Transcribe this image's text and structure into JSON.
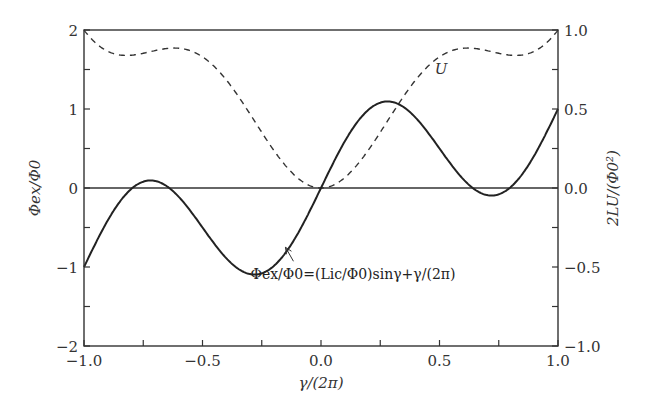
{
  "chart_data": {
    "type": "line",
    "title": "",
    "xlabel": "γ/(2π)",
    "ylabel_left": "Φex/Φ0",
    "ylabel_right": "2LU/(Φ0²)",
    "xlim": [
      -1.0,
      1.0
    ],
    "ylim_left": [
      -2,
      2
    ],
    "ylim_right": [
      -1.0,
      1.0
    ],
    "x_ticks": [
      "−1.0",
      "−0.5",
      "0.0",
      "0.5",
      "1.0"
    ],
    "y_ticks_left": [
      "2",
      "1",
      "0",
      "−1",
      "−2"
    ],
    "y_ticks_right": [
      "1.0",
      "0.5",
      "0.0",
      "−0.5",
      "−1.0"
    ],
    "grid": false,
    "zero_line": true,
    "series": [
      {
        "name": "Φex/Φ0",
        "style": "solid",
        "axis": "left",
        "formula": "Φex/Φ0 = (Lic/Φ0) sinγ + γ/(2π)",
        "x": [
          -1.0,
          -0.875,
          -0.73,
          -0.5,
          -0.27,
          -0.125,
          0.0,
          0.125,
          0.27,
          0.5,
          0.73,
          0.875,
          1.0
        ],
        "values": [
          -1.0,
          -0.46,
          0.1,
          -0.5,
          -1.1,
          -0.71,
          0.0,
          0.71,
          1.1,
          0.5,
          -0.1,
          0.46,
          1.0
        ]
      },
      {
        "name": "U",
        "style": "dashed",
        "axis": "right",
        "x": [
          -1.0,
          -0.75,
          -0.5,
          -0.25,
          0.0,
          0.25,
          0.5,
          0.75,
          1.0
        ],
        "values": [
          1.0,
          0.85,
          0.83,
          0.35,
          0.0,
          0.35,
          0.83,
          0.85,
          1.0
        ]
      }
    ],
    "annotations": [
      {
        "text": "U",
        "near_x": 0.5,
        "near_y_right": 0.72
      },
      {
        "text": "Φex/Φ0=(Lic/Φ0)sinγ+γ/(2π)",
        "arrow_to_x": -0.15,
        "arrow_to_y_left": -0.75
      }
    ],
    "params": {
      "Lic_over_Phi0": 0.83
    }
  },
  "labels": {
    "u_label": "U"
  }
}
